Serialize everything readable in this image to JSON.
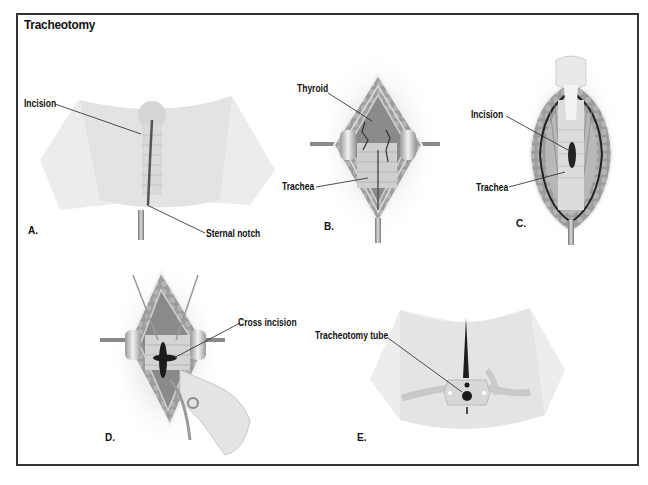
{
  "figure": {
    "title": "Tracheotomy",
    "panels": [
      {
        "id": "A",
        "letter": "A.",
        "labels": [
          "Incision",
          "Sternal notch"
        ]
      },
      {
        "id": "B",
        "letter": "B.",
        "labels": [
          "Thyroid",
          "Trachea"
        ]
      },
      {
        "id": "C",
        "letter": "C.",
        "labels": [
          "Incision",
          "Trachea"
        ]
      },
      {
        "id": "D",
        "letter": "D.",
        "labels": [
          "Cross incision"
        ]
      },
      {
        "id": "E",
        "letter": "E.",
        "labels": [
          "Tracheotomy tube"
        ]
      }
    ]
  },
  "colors": {
    "frame": "#333333",
    "skin": "#e6e6e6",
    "tissue": "#8f8f8f",
    "dark": "#222222",
    "text": "#111111"
  }
}
